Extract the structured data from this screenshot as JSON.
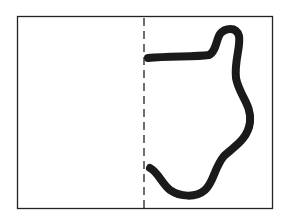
{
  "diagram": {
    "frame": {
      "x": 17,
      "y": 16,
      "width": 255,
      "height": 192,
      "stroke": "#222222"
    },
    "fold_line": {
      "x": 144,
      "y1": 17,
      "y2": 208,
      "style": "dashed",
      "stroke": "#222222"
    },
    "curve": {
      "stroke": "#1a1a1a",
      "stroke_width": 8
    },
    "background": "#ffffff"
  }
}
